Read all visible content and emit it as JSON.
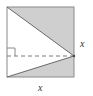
{
  "diagram": {
    "type": "geometry-figure",
    "colors": {
      "background": "#ffffff",
      "shade": "#cfcfcf",
      "stroke": "#8a8a8a",
      "dashed": "#7a7a7a",
      "label": "#333333"
    },
    "square": {
      "x": 7,
      "y": 7,
      "width": 67,
      "height": 70
    },
    "apex_point": {
      "x": 74,
      "y": 56
    },
    "dashed_line_y": 56,
    "labels": {
      "right_side": "x",
      "bottom_side": "x"
    }
  }
}
